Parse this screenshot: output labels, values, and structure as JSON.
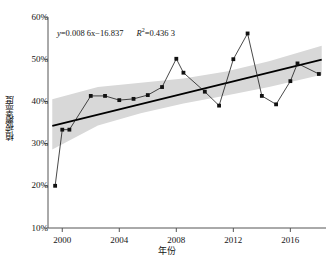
{
  "chart_data": {
    "type": "line",
    "title": "",
    "xlabel": "年份",
    "ylabel": "植被覆盖度",
    "xlim": [
      1999,
      2018.5
    ],
    "ylim": [
      10,
      60
    ],
    "yunit": "%",
    "grid": false,
    "legend": null,
    "xticks": [
      2000,
      2004,
      2008,
      2012,
      2016
    ],
    "xtick_labels": [
      "2000",
      "2004",
      "2008",
      "2012",
      "2016"
    ],
    "yticks": [
      10,
      20,
      30,
      40,
      50,
      60
    ],
    "ytick_labels": [
      "10%",
      "20%",
      "30%",
      "40%",
      "50%",
      "60%"
    ],
    "series": [
      {
        "name": "植被覆盖度",
        "marker": "square",
        "color": "#1a1a1a",
        "x": [
          1999.5,
          2000,
          2000.5,
          2002,
          2003,
          2004,
          2005,
          2006,
          2007,
          2008,
          2008.5,
          2010,
          2011,
          2012,
          2013,
          2014,
          2015,
          2016,
          2016.5,
          2018
        ],
        "values": [
          20.0,
          33.3,
          33.3,
          41.3,
          41.3,
          40.3,
          40.6,
          41.5,
          43.4,
          50.1,
          46.8,
          42.3,
          39.0,
          50.0,
          56.1,
          41.3,
          39.3,
          44.8,
          49.0,
          46.5
        ]
      }
    ],
    "trendline": {
      "name": "linear-fit",
      "color": "#000000",
      "x": [
        1999.3,
        2018.2
      ],
      "values": [
        34.2,
        49.9
      ]
    },
    "confidence_band": {
      "fill": "#d8d8d8",
      "x": [
        1999.3,
        2002.5,
        2005.5,
        2008.5,
        2011.5,
        2014.5,
        2018.2
      ],
      "upper": [
        40.5,
        43.4,
        44.4,
        45.4,
        47.1,
        49.5,
        53.2
      ],
      "lower": [
        28.6,
        34.3,
        37.2,
        39.5,
        41.4,
        43.4,
        46.3
      ]
    },
    "annotation": {
      "equation_lhs": "y",
      "equation_rhs": "=0.008 6x−16.837",
      "equation_full": "y=0.008 6x−16.837",
      "r_symbol": "R",
      "r_exponent": "2",
      "r_value": "=0.436 3",
      "r_squared_full": "R²=0.436 3"
    },
    "colors": {
      "line": "#1a1a1a",
      "marker": "#111111",
      "trend": "#000000",
      "band": "#d8d8d8",
      "axis": "#555555",
      "text": "#141414"
    }
  }
}
